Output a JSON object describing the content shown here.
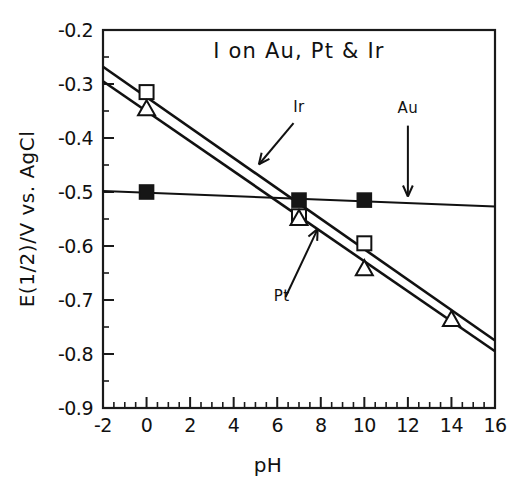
{
  "chart_data": {
    "type": "scatter",
    "title": "I on Au, Pt & Ir",
    "xlabel": "pH",
    "ylabel": "E(1/2)/V vs. AgCl",
    "xlim": [
      -2,
      16
    ],
    "ylim": [
      -0.9,
      -0.2
    ],
    "grid": false,
    "legend": "none",
    "xticks": [
      -2,
      0,
      2,
      4,
      6,
      8,
      10,
      12,
      14,
      16
    ],
    "xtick_labels": [
      "-2",
      "0",
      "2",
      "4",
      "6",
      "8",
      "10",
      "12",
      "14",
      "16"
    ],
    "yticks": [
      -0.2,
      -0.3,
      -0.4,
      -0.5,
      -0.6,
      -0.7,
      -0.8,
      -0.9
    ],
    "ytick_labels": [
      "-0.2",
      "-0.3",
      "-0.4",
      "-0.5",
      "-0.6",
      "-0.7",
      "-0.8",
      "-0.9"
    ],
    "x_minor_per_major": 4,
    "y_minor_per_major": 2,
    "series": [
      {
        "name": "Au",
        "marker": "filled-square",
        "x": [
          0,
          7,
          10
        ],
        "y": [
          -0.5,
          -0.515,
          -0.515
        ],
        "fit_line": {
          "x": [
            -2,
            16
          ],
          "y": [
            -0.498,
            -0.527
          ]
        }
      },
      {
        "name": "Pt",
        "marker": "open-square",
        "x": [
          0,
          7,
          10
        ],
        "y": [
          -0.315,
          -0.545,
          -0.595
        ],
        "fit_line": {
          "x": [
            -2,
            16
          ],
          "y": [
            -0.268,
            -0.775
          ]
        }
      },
      {
        "name": "Ir",
        "marker": "open-triangle",
        "x": [
          0,
          7,
          10,
          14
        ],
        "y": [
          -0.345,
          -0.548,
          -0.641,
          -0.735
        ],
        "fit_line": {
          "x": [
            -2,
            16
          ],
          "y": [
            -0.295,
            -0.795
          ]
        }
      }
    ],
    "annotations": [
      {
        "label": "Ir",
        "label_x": 7.0,
        "label_y": -0.352,
        "point_x": 5.1,
        "point_y": -0.452
      },
      {
        "label": "Au",
        "label_x": 12.0,
        "label_y": -0.353,
        "point_x": 12.0,
        "point_y": -0.512
      },
      {
        "label": "Pt",
        "label_x": 6.2,
        "label_y": -0.702,
        "point_x": 7.9,
        "point_y": -0.565
      }
    ]
  }
}
